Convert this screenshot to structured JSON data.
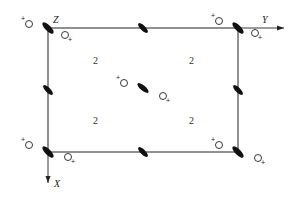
{
  "diagram": {
    "frame": {
      "x1": 48,
      "y1": 28,
      "x2": 238,
      "y2": 152,
      "stroke": "#222222"
    },
    "axes": {
      "z_label": "Z",
      "y_label": "Y",
      "x_label": "X"
    },
    "site_labels": [
      "2",
      "2",
      "2",
      "2"
    ],
    "plus_sign": "+",
    "ellipse_color": "#111111",
    "circle_stroke": "#222222"
  }
}
